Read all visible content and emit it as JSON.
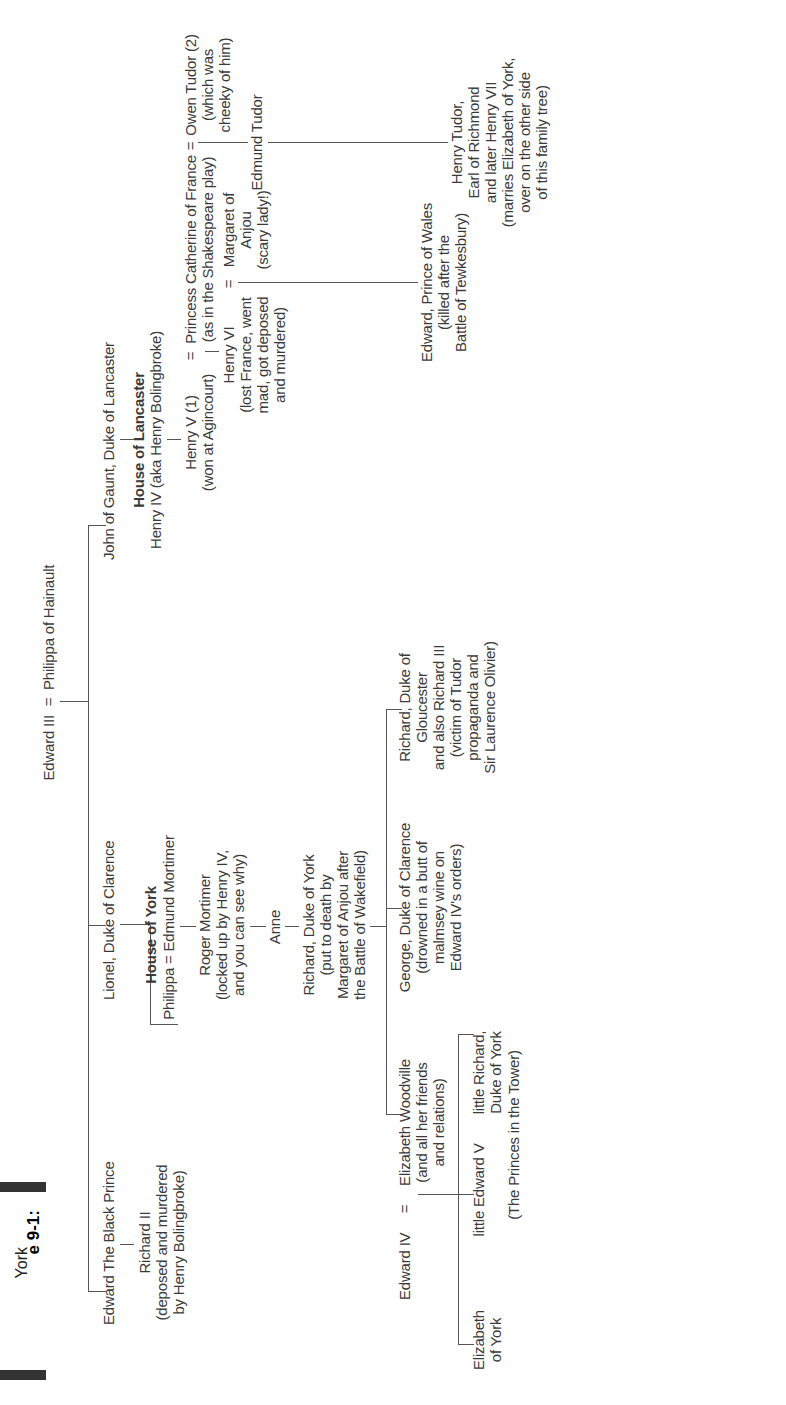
{
  "caption": {
    "label": "e 9-1:",
    "lines": [
      "York",
      "and",
      "aster",
      "tree."
    ]
  },
  "tree": {
    "root": {
      "name": "Edward III",
      "spouse": "Philippa of Hainault",
      "marriage_symbol": "="
    },
    "gen1": {
      "black_prince": "Edward The Black Prince",
      "lionel": "Lionel, Duke of Clarence",
      "john_of_gaunt": "John of Gaunt, Duke of Lancaster"
    },
    "richard_ii": {
      "name": "Richard II",
      "note1": "(deposed and murdered",
      "note2": "by Henry Bolingbroke)"
    },
    "house_of_york": {
      "title": "House of York",
      "couple": "Philippa = Edmund Mortimer"
    },
    "roger_mortimer": {
      "name": "Roger Mortimer",
      "note1": "(locked up by Henry IV,",
      "note2": "and you can see why)"
    },
    "anne": "Anne",
    "richard_duke_of_york": {
      "name": "Richard, Duke of York",
      "note1": "(put to death by",
      "note2": "Margaret of Anjou after",
      "note3": "the Battle of Wakefield)"
    },
    "house_of_lancaster": {
      "title": "House of Lancaster",
      "name": "Henry IV (aka Henry Bolingbroke)"
    },
    "henry_v": {
      "name": "Henry V (1)",
      "note": "(won at Agincourt)"
    },
    "catherine": {
      "name": "Princess Catherine of France",
      "note": "(as in the Shakespeare play)"
    },
    "owen_tudor": {
      "name": "Owen Tudor (2)",
      "note1": "(which was",
      "note2": "cheeky of him)"
    },
    "henry_vi": {
      "name": "Henry VI",
      "note1": "(lost France, went",
      "note2": "mad, got deposed",
      "note3": "and murdered)"
    },
    "margaret_of_anjou": {
      "name1": "Margaret of",
      "name2": "Anjou",
      "note": "(scary lady!)"
    },
    "edmund_tudor": "Edmund Tudor",
    "edward_prince_of_wales": {
      "name": "Edward, Prince of Wales",
      "note1": "(killed after the",
      "note2": "Battle of Tewkesbury)"
    },
    "henry_tudor": {
      "name": "Henry Tudor,",
      "line2": "Earl of Richmond",
      "line3": "and later Henry VII",
      "note1": "(marries Elizabeth of York,",
      "note2": "over on the other side",
      "note3": "of this family tree)"
    },
    "edward_iv": "Edward IV",
    "elizabeth_woodville": {
      "name": "Elizabeth Woodville",
      "note1": "(and all her friends",
      "note2": "and relations)"
    },
    "george": {
      "name": "George, Duke of Clarence",
      "note1": "(drowned in a butt of",
      "note2": "malmsey wine on",
      "note3": "Edward IV's orders)"
    },
    "richard_iii": {
      "name": "Richard, Duke of",
      "line2": "Gloucester",
      "line3": "and also Richard III",
      "note1": "(victim of Tudor",
      "note2": "propaganda and",
      "note3": "Sir Laurence Olivier)"
    },
    "elizabeth_of_york": {
      "line1": "Elizabeth",
      "line2": "of York"
    },
    "little_edward_v": "little Edward V",
    "little_richard": {
      "line1": "little Richard,",
      "line2": "Duke of York"
    },
    "princes_note": "(The Princes in the Tower)"
  }
}
